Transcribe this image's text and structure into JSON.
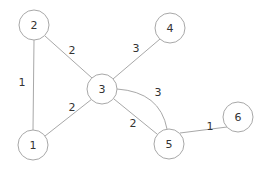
{
  "graph": {
    "nodes": [
      {
        "id": "1",
        "label": "1",
        "x": 33,
        "y": 145
      },
      {
        "id": "2",
        "label": "2",
        "x": 34,
        "y": 25
      },
      {
        "id": "3",
        "label": "3",
        "x": 102,
        "y": 89
      },
      {
        "id": "4",
        "label": "4",
        "x": 170,
        "y": 28
      },
      {
        "id": "5",
        "label": "5",
        "x": 169,
        "y": 144
      },
      {
        "id": "6",
        "label": "6",
        "x": 238,
        "y": 117
      }
    ],
    "edges": [
      {
        "from": "2",
        "to": "1",
        "weight": "1",
        "lx": 22,
        "ly": 82
      },
      {
        "from": "2",
        "to": "3",
        "weight": "2",
        "lx": 72,
        "ly": 50
      },
      {
        "from": "1",
        "to": "3",
        "weight": "2",
        "lx": 72,
        "ly": 107
      },
      {
        "from": "3",
        "to": "4",
        "weight": "3",
        "lx": 136,
        "ly": 48
      },
      {
        "from": "3",
        "to": "5",
        "weight": "3",
        "lx": 158,
        "ly": 92,
        "curved": true
      },
      {
        "from": "3",
        "to": "5",
        "weight": "2",
        "lx": 133,
        "ly": 123
      },
      {
        "from": "5",
        "to": "6",
        "weight": "1",
        "lx": 210,
        "ly": 126
      }
    ]
  }
}
